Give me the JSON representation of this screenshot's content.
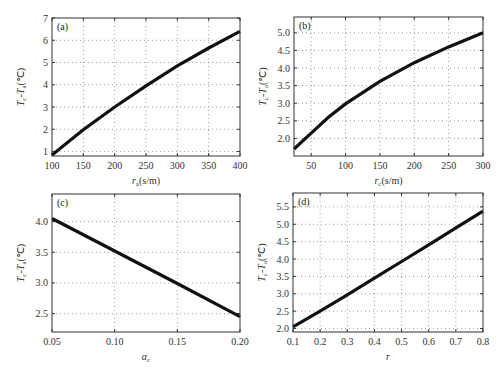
{
  "chart_data": [
    {
      "id": "a",
      "type": "line",
      "panel_label": "(a)",
      "xlabel": "r_a(s/m)",
      "xlabel_main": "r",
      "xlabel_sub": "a",
      "xlabel_unit": "(s/m)",
      "ylabel": "T_c - T_a(℃)",
      "xlim": [
        100,
        400
      ],
      "ylim": [
        0.8,
        7
      ],
      "xticks": [
        100,
        150,
        200,
        250,
        300,
        350,
        400
      ],
      "yticks": [
        1,
        2,
        3,
        4,
        5,
        6,
        7
      ],
      "xtick_labels": [
        "100",
        "150",
        "200",
        "250",
        "300",
        "350",
        "400"
      ],
      "ytick_labels": [
        "1",
        "2",
        "3",
        "4",
        "5",
        "6",
        "7"
      ],
      "grid": true,
      "x": [
        100,
        150,
        200,
        250,
        300,
        350,
        400
      ],
      "values": [
        0.85,
        1.98,
        3.0,
        3.95,
        4.85,
        5.65,
        6.4
      ],
      "plot_box": {
        "left": 52,
        "top": 18,
        "right": 240,
        "bottom": 156
      }
    },
    {
      "id": "b",
      "type": "line",
      "panel_label": "(b)",
      "xlabel": "r_c(s/m)",
      "xlabel_main": "r",
      "xlabel_sub": "c",
      "xlabel_unit": "(s/m)",
      "ylabel": "T_c - T_a(℃)",
      "xlim": [
        25,
        300
      ],
      "ylim": [
        1.5,
        5.45
      ],
      "xticks": [
        50,
        100,
        150,
        200,
        250,
        300
      ],
      "yticks": [
        2.0,
        2.5,
        3.0,
        3.5,
        4.0,
        4.5,
        5.0
      ],
      "xtick_labels": [
        "50",
        "100",
        "150",
        "200",
        "250",
        "300"
      ],
      "ytick_labels": [
        "2.0",
        "2.5",
        "3.0",
        "3.5",
        "4.0",
        "4.5",
        "5.0"
      ],
      "grid": true,
      "x": [
        25,
        50,
        75,
        100,
        150,
        200,
        250,
        300
      ],
      "values": [
        1.7,
        2.15,
        2.6,
        2.98,
        3.62,
        4.15,
        4.6,
        5.0
      ],
      "plot_box": {
        "left": 294,
        "top": 17,
        "right": 483,
        "bottom": 156
      }
    },
    {
      "id": "c",
      "type": "line",
      "panel_label": "(c)",
      "xlabel": "α_c",
      "xlabel_main": "α",
      "xlabel_sub": "c",
      "xlabel_unit": "",
      "ylabel": "T_c - T_a(℃)",
      "xlim": [
        0.05,
        0.2
      ],
      "ylim": [
        2.2,
        4.45
      ],
      "xticks": [
        0.05,
        0.1,
        0.15,
        0.2
      ],
      "yticks": [
        2.5,
        3.0,
        3.5,
        4.0
      ],
      "xtick_labels": [
        "0.05",
        "0.10",
        "0.15",
        "0.20"
      ],
      "ytick_labels": [
        "2.5",
        "3.0",
        "3.5",
        "4.0"
      ],
      "grid": true,
      "x": [
        0.05,
        0.1,
        0.15,
        0.2
      ],
      "values": [
        4.05,
        3.52,
        2.99,
        2.45
      ],
      "plot_box": {
        "left": 52,
        "top": 194,
        "right": 240,
        "bottom": 332
      }
    },
    {
      "id": "d",
      "type": "line",
      "panel_label": "(d)",
      "xlabel": "r",
      "xlabel_main": "r",
      "xlabel_sub": "",
      "xlabel_unit": "",
      "ylabel": "T_c - T_a(℃)",
      "xlim": [
        0.1,
        0.8
      ],
      "ylim": [
        1.9,
        5.9
      ],
      "xticks": [
        0.1,
        0.2,
        0.3,
        0.4,
        0.5,
        0.6,
        0.7,
        0.8
      ],
      "yticks": [
        2.0,
        2.5,
        3.0,
        3.5,
        4.0,
        4.5,
        5.0,
        5.5
      ],
      "xtick_labels": [
        "0.1",
        "0.2",
        "0.3",
        "0.4",
        "0.5",
        "0.6",
        "0.7",
        "0.8"
      ],
      "ytick_labels": [
        "2.0",
        "2.5",
        "3.0",
        "3.5",
        "4.0",
        "4.5",
        "5.0",
        "5.5"
      ],
      "grid": true,
      "x": [
        0.1,
        0.2,
        0.3,
        0.4,
        0.5,
        0.6,
        0.7,
        0.8
      ],
      "values": [
        2.05,
        2.5,
        2.97,
        3.45,
        3.93,
        4.41,
        4.9,
        5.38
      ],
      "plot_box": {
        "left": 293,
        "top": 193,
        "right": 483,
        "bottom": 332
      }
    }
  ],
  "ylabel_parts": {
    "t1": "T",
    "s1": "c",
    "dash": "-",
    "t2": "T",
    "s2": "a",
    "unit": "(℃)"
  }
}
